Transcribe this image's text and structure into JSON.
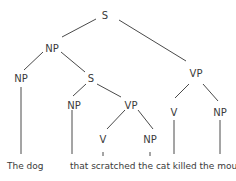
{
  "diagram": {
    "type": "syntax-tree",
    "nodes": {
      "root": {
        "label": "S"
      },
      "np_main": {
        "label": "NP"
      },
      "vp_main": {
        "label": "VP"
      },
      "np_head": {
        "label": "NP"
      },
      "s_rel": {
        "label": "S"
      },
      "np_rel": {
        "label": "NP"
      },
      "vp_rel": {
        "label": "VP"
      },
      "v_rel": {
        "label": "V"
      },
      "np_obj_rel": {
        "label": "NP"
      },
      "v_main": {
        "label": "V"
      },
      "np_obj_main": {
        "label": "NP"
      }
    },
    "words": {
      "w1": "The dog",
      "w2": "that scratched the cat killed the mouse"
    },
    "edges": [
      [
        "root",
        "np_main"
      ],
      [
        "root",
        "vp_main"
      ],
      [
        "np_main",
        "np_head"
      ],
      [
        "np_main",
        "s_rel"
      ],
      [
        "s_rel",
        "np_rel"
      ],
      [
        "s_rel",
        "vp_rel"
      ],
      [
        "vp_rel",
        "v_rel"
      ],
      [
        "vp_rel",
        "np_obj_rel"
      ],
      [
        "vp_main",
        "v_main"
      ],
      [
        "vp_main",
        "np_obj_main"
      ],
      [
        "np_head",
        "The dog"
      ],
      [
        "np_rel",
        "that"
      ],
      [
        "v_rel",
        "scratched"
      ],
      [
        "np_obj_rel",
        "the cat"
      ],
      [
        "v_main",
        "killed"
      ],
      [
        "np_obj_main",
        "the mouse"
      ]
    ]
  }
}
